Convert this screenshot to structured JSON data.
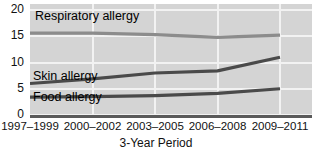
{
  "chart_data": {
    "type": "line",
    "title": "",
    "xlabel": "3-Year Period",
    "ylabel": "",
    "categories": [
      "1997–1999",
      "2000–2002",
      "2003–2005",
      "2006–2008",
      "2009–2011"
    ],
    "ylim": [
      0,
      20
    ],
    "yticks": [
      0,
      5,
      10,
      15,
      20
    ],
    "ytick_labels": [
      "0",
      "5",
      "10",
      "15",
      "20"
    ],
    "grid": true,
    "legend_position": "inline-labels",
    "series": [
      {
        "name": "Respiratory allergy",
        "color": "#8c8c8c",
        "values": [
          15.6,
          15.6,
          15.3,
          14.8,
          15.2
        ]
      },
      {
        "name": "Skin allergy",
        "color": "#4a4a4a",
        "values": [
          6.0,
          6.9,
          8.0,
          8.4,
          11.0
        ]
      },
      {
        "name": "Food allergy",
        "color": "#4a4a4a",
        "values": [
          3.4,
          3.5,
          3.7,
          4.1,
          5.0
        ]
      }
    ],
    "annotations": [
      {
        "text": "Respiratory allergy",
        "series": "Respiratory allergy"
      },
      {
        "text": "Skin allergy",
        "series": "Skin allergy"
      },
      {
        "text": "Food allergy",
        "series": "Food allergy"
      }
    ]
  },
  "colors": {
    "plot_background": "#d4d4d4",
    "gridline": "#f2f2f2",
    "axis_line": "#5a5a5a",
    "text": "#111111"
  }
}
